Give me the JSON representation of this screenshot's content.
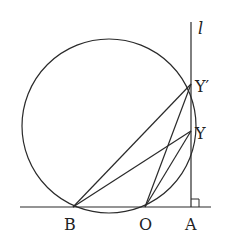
{
  "diagram": {
    "type": "geometry",
    "line_label": "l",
    "points": {
      "B": {
        "label": "B",
        "x": 73,
        "y": 207
      },
      "O": {
        "label": "O",
        "x": 145,
        "y": 207
      },
      "A": {
        "label": "A",
        "x": 191,
        "y": 207
      },
      "Y": {
        "label": "Y",
        "x": 191,
        "y": 131
      },
      "Yp": {
        "label": "Y′",
        "x": 191,
        "y": 84
      }
    },
    "circle": {
      "cx": 109,
      "cy": 126,
      "r": 87
    },
    "segments": [
      [
        "B",
        "Yp"
      ],
      [
        "B",
        "Y"
      ],
      [
        "O",
        "Yp"
      ],
      [
        "O",
        "Y"
      ]
    ],
    "right_angle_at": "A",
    "stroke_color": "#2a2a2a"
  }
}
